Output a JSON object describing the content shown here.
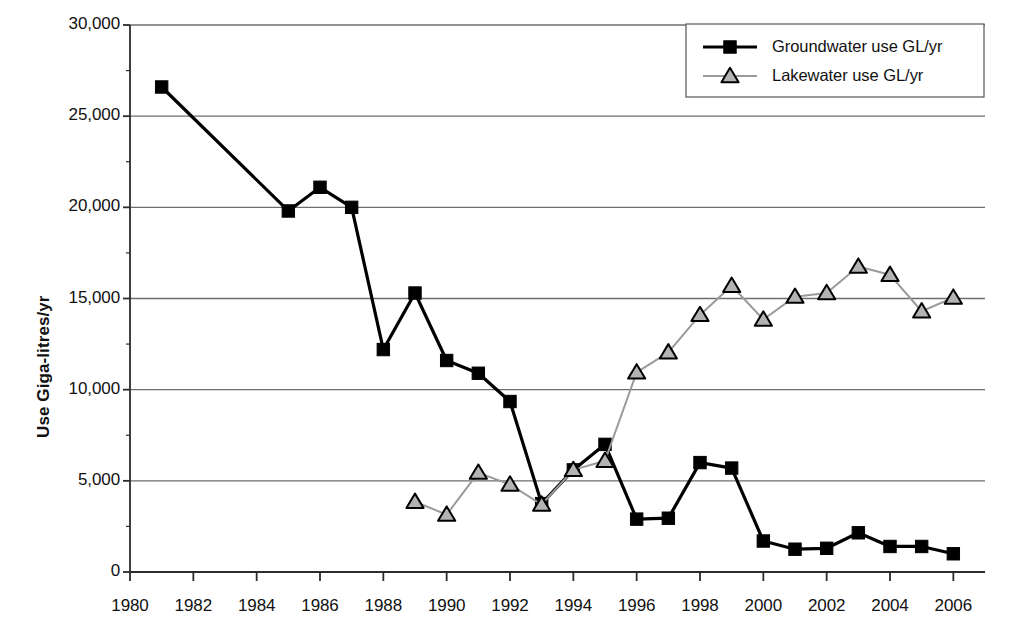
{
  "chart_data": {
    "type": "line",
    "title": "",
    "xlabel": "",
    "ylabel": "Use Giga-litres/yr",
    "xlim": [
      1980,
      2007
    ],
    "ylim": [
      0,
      30000
    ],
    "grid": "horizontal",
    "legend_position": "top-right",
    "x_tick_labels": [
      "1980",
      "1982",
      "1984",
      "1986",
      "1988",
      "1990",
      "1992",
      "1994",
      "1996",
      "1998",
      "2000",
      "2002",
      "2004",
      "2006"
    ],
    "x_tick_values": [
      1980,
      1982,
      1984,
      1986,
      1988,
      1990,
      1992,
      1994,
      1996,
      1998,
      2000,
      2002,
      2004,
      2006
    ],
    "y_tick_labels": [
      "0",
      "5,000",
      "10,000",
      "15,000",
      "20,000",
      "25,000",
      "30,000"
    ],
    "y_tick_values": [
      0,
      5000,
      10000,
      15000,
      20000,
      25000,
      30000
    ],
    "series": [
      {
        "name": "Groundwater use GL/yr",
        "marker": "square",
        "marker_fill": "#000000",
        "line_color": "#000000",
        "x": [
          1981,
          1985,
          1986,
          1987,
          1988,
          1989,
          1990,
          1991,
          1992,
          1993,
          1994,
          1995,
          1996,
          1997,
          1998,
          1999,
          2000,
          2001,
          2002,
          2003,
          2004,
          2005,
          2006
        ],
        "values": [
          26600,
          19800,
          21100,
          20000,
          12200,
          15300,
          11600,
          10900,
          9350,
          3750,
          5600,
          7000,
          2900,
          2950,
          6000,
          5700,
          1700,
          1250,
          1300,
          2150,
          1400,
          1400,
          1000
        ]
      },
      {
        "name": "Lakewater use GL/yr",
        "marker": "triangle",
        "marker_fill": "#b3b3b3",
        "line_color": "#9a9a9a",
        "x": [
          1989,
          1990,
          1991,
          1992,
          1993,
          1994,
          1995,
          1996,
          1997,
          1998,
          1999,
          2000,
          2001,
          2002,
          2003,
          2004,
          2005,
          2006
        ],
        "values": [
          3850,
          3150,
          5450,
          4800,
          3700,
          5600,
          6100,
          10950,
          12050,
          14100,
          15700,
          13850,
          15100,
          15300,
          16750,
          16300,
          14300,
          15050
        ]
      }
    ]
  },
  "legend": {
    "items": [
      {
        "label": "Groundwater use GL/yr",
        "marker": "square-marker-icon"
      },
      {
        "label": "Lakewater use GL/yr",
        "marker": "triangle-marker-icon"
      }
    ]
  },
  "colors": {
    "groundwater": "#000000",
    "lakewater_fill": "#b3b3b3",
    "lakewater_line": "#9a9a9a",
    "grid": "#6e6e6e",
    "axis": "#2b2b2b",
    "text": "#111111"
  }
}
